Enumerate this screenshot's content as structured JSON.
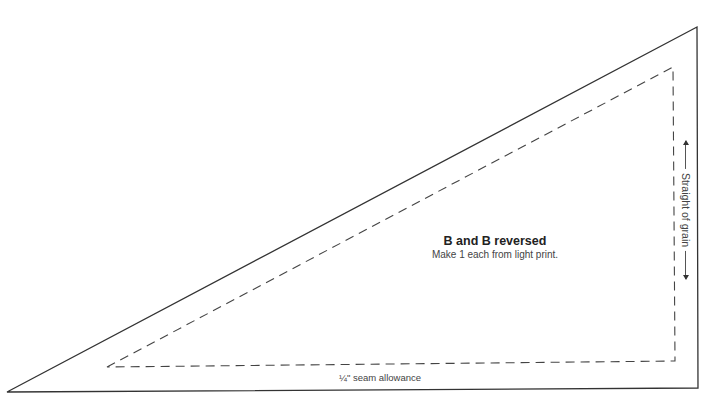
{
  "pattern": {
    "piece_name": "B and B reversed",
    "instruction": "Make 1 each from light print.",
    "seam_label": "¼\" seam allowance",
    "grain_label": "Straight of grain",
    "outer_triangle": [
      [
        7,
        392
      ],
      [
        697,
        27
      ],
      [
        698,
        388
      ]
    ],
    "inner_dashed_triangle": [
      [
        107,
        367
      ],
      [
        673,
        67
      ],
      [
        675,
        361
      ]
    ],
    "colors": {
      "cut_line": "#333333",
      "seam_line": "#444444",
      "text": "#333333"
    }
  }
}
